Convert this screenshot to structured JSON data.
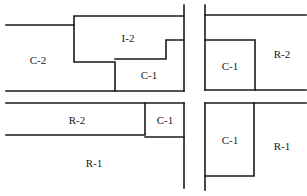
{
  "diagram": {
    "type": "zoning-map",
    "zones": [
      {
        "id": "nw-c2",
        "label": "C-2",
        "x": 38,
        "y": 60
      },
      {
        "id": "nw-i2",
        "label": "I-2",
        "x": 128,
        "y": 38
      },
      {
        "id": "nw-c1",
        "label": "C-1",
        "x": 149,
        "y": 75
      },
      {
        "id": "ne-c1",
        "label": "C-1",
        "x": 230,
        "y": 66
      },
      {
        "id": "ne-r2",
        "label": "R-2",
        "x": 282,
        "y": 54
      },
      {
        "id": "sw-r2",
        "label": "R-2",
        "x": 77,
        "y": 120
      },
      {
        "id": "sw-c1",
        "label": "C-1",
        "x": 165,
        "y": 120
      },
      {
        "id": "sw-r1",
        "label": "R-1",
        "x": 94,
        "y": 163
      },
      {
        "id": "se-c1",
        "label": "C-1",
        "x": 230,
        "y": 140
      },
      {
        "id": "se-r1",
        "label": "R-1",
        "x": 282,
        "y": 146
      }
    ],
    "line_color": "#1a1a1a",
    "background": "#ffffff"
  }
}
